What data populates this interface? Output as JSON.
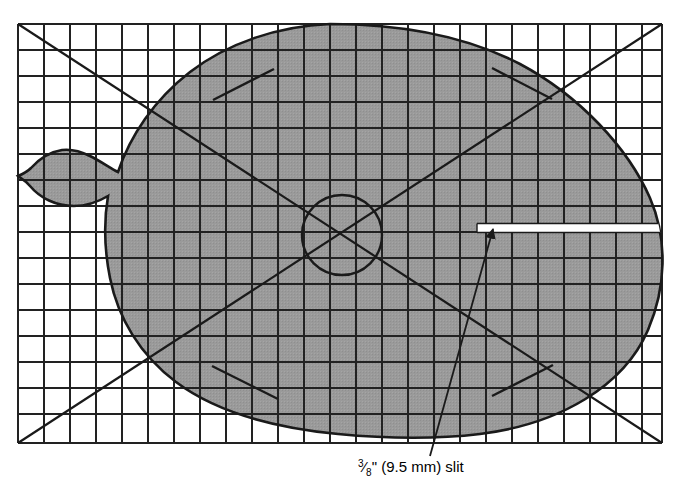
{
  "diagram": {
    "fill_color": "#9a9a9a",
    "line_color": "#1a1a1a",
    "background_color": "#ffffff",
    "grid": {
      "x0": 18,
      "y0": 24,
      "x1": 662,
      "y1": 443,
      "cell_size": 26,
      "columns": 24,
      "rows": 16,
      "visible": true
    },
    "shape": {
      "name": "rounded-blob-with-spout",
      "description": "Large shaded oval blob with a narrow spout protruding to the left",
      "top_y": 24,
      "bottom_y": 437,
      "left_x": 18,
      "right_x": 672
    },
    "center_circle": {
      "cx": 342,
      "cy": 235,
      "r": 40
    },
    "diagonals": [
      {
        "name": "main-diagonal",
        "x1": 18,
        "y1": 443,
        "x2": 662,
        "y2": 24
      },
      {
        "name": "anti-diagonal",
        "x1": 18,
        "y1": 24,
        "x2": 662,
        "y2": 443
      }
    ],
    "tick_marks": [
      {
        "name": "tick-top-left",
        "x1": 213,
        "y1": 100,
        "x2": 274,
        "y2": 69
      },
      {
        "name": "tick-top-right",
        "x1": 492,
        "y1": 68,
        "x2": 552,
        "y2": 99
      },
      {
        "name": "tick-bottom-left",
        "x1": 212,
        "y1": 366,
        "x2": 278,
        "y2": 399
      },
      {
        "name": "tick-bottom-right",
        "x1": 492,
        "y1": 396,
        "x2": 553,
        "y2": 365
      }
    ],
    "slit": {
      "name": "slit-opening",
      "x_start": 477,
      "x_end": 673,
      "y_top": 223,
      "y_bottom": 233,
      "color": "#ffffff"
    },
    "leader": {
      "tail_x": 430,
      "tail_y": 456,
      "tip_x": 491,
      "tip_y": 231
    }
  },
  "callout": {
    "fraction_numerator": "3",
    "fraction_denominator": "8",
    "label_after_fraction": "\" (9.5 mm) slit",
    "full_text": "⅜\" (9.5 mm) slit",
    "x": 358,
    "y": 472
  }
}
